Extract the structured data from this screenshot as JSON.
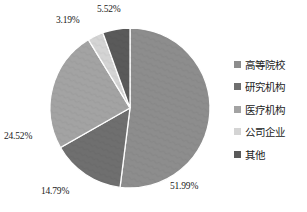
{
  "chart_data": {
    "type": "pie",
    "title": "",
    "xlabel": "",
    "ylabel": "",
    "legend_position": "right",
    "grid": false,
    "categories": [
      "高等院校",
      "研究机构",
      "医疗机构",
      "公司企业",
      "其他"
    ],
    "values": [
      51.99,
      14.79,
      24.52,
      3.19,
      5.52
    ],
    "value_labels": [
      "51.99%",
      "14.79%",
      "24.52%",
      "3.19%",
      "5.52%"
    ],
    "colors": [
      "#8d8d8d",
      "#6f6f6f",
      "#a3a3a3",
      "#d4d4d4",
      "#5a5a5a"
    ],
    "slice_separator_color": "#ffffff",
    "start_angle_deg": 0,
    "direction": "clockwise"
  },
  "legend": {
    "items": [
      {
        "label": "高等院校",
        "color": "#8d8d8d"
      },
      {
        "label": "研究机构",
        "color": "#6f6f6f"
      },
      {
        "label": "医疗机构",
        "color": "#a3a3a3"
      },
      {
        "label": "公司企业",
        "color": "#d4d4d4"
      },
      {
        "label": "其他",
        "color": "#5a5a5a"
      }
    ]
  },
  "labels": {
    "higher_education": "51.99%",
    "research_institutions": "14.79%",
    "medical_institutions": "24.52%",
    "companies": "3.19%",
    "other": "5.52%"
  }
}
